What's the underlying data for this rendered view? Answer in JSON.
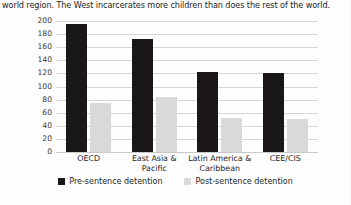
{
  "caption": {
    "text": "world region. The West incarcerates more children than does the rest of the world."
  },
  "chart_data": {
    "type": "bar",
    "title": "",
    "xlabel": "",
    "ylabel": "",
    "categories": [
      "OECD",
      "East Asia & Pacific",
      "Latin America & Caribbean",
      "CEE/CIS"
    ],
    "series": [
      {
        "name": "Pre-sentence detention",
        "color": "#1a1718",
        "values": [
          195,
          172,
          122,
          120
        ]
      },
      {
        "name": "Post-sentence detention",
        "color": "#d9d9d9",
        "values": [
          75,
          84,
          52,
          50
        ]
      }
    ],
    "ylim": [
      0,
      200
    ],
    "yticks": [
      200,
      180,
      160,
      140,
      120,
      100,
      80,
      60,
      40,
      20,
      0
    ],
    "grid": true,
    "legend_position": "bottom"
  }
}
